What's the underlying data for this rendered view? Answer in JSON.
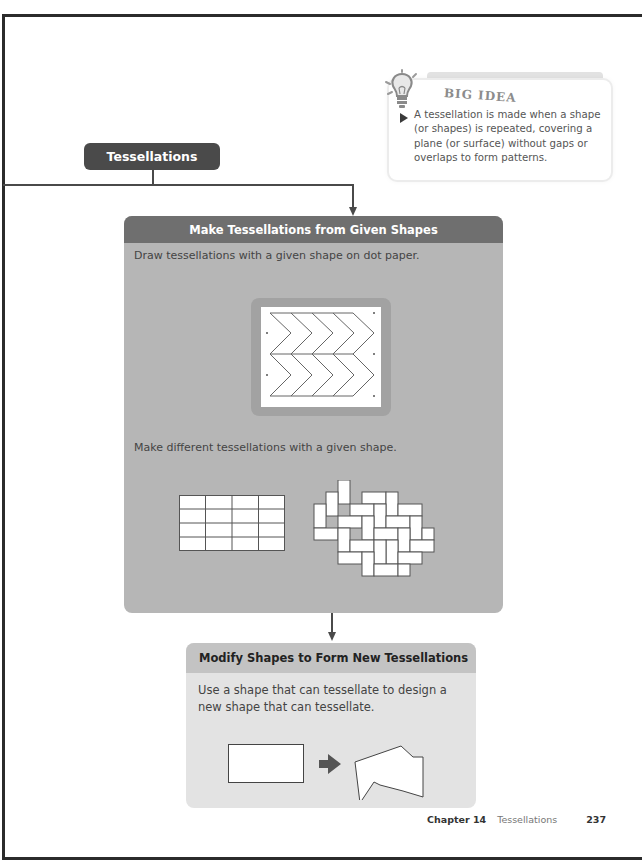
{
  "big_idea": {
    "title": "BIG IDEA",
    "text": "A tessellation is made when a shape (or shapes) is repeated, covering a plane (or surface) without gaps or overlaps to form patterns.",
    "icon": "lightbulb-icon"
  },
  "topic": {
    "label": "Tessellations"
  },
  "section1": {
    "header": "Make Tessellations from Given Shapes",
    "text1": "Draw tessellations with a given shape on dot paper.",
    "text2": "Make different tessellations with a given shape."
  },
  "section2": {
    "header": "Modify Shapes to Form New Tessellations",
    "text_line1": "Use a shape that can tessellate to design a",
    "text_line2": "new shape that can tessellate."
  },
  "footer": {
    "chapter": "Chapter 14",
    "title": "Tessellations",
    "page": "237"
  },
  "colors": {
    "dark_header": "#6f6f6f",
    "panel_bg": "#b6b6b6",
    "light_panel_bg": "#e3e3e3",
    "light_header": "#c3c3c3",
    "pill": "#4a4a4a"
  }
}
